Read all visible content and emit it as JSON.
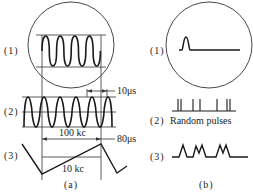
{
  "figure": {
    "panel_a": {
      "caption": "(a)",
      "rows": [
        {
          "label": "(1)",
          "description": "CRT display of sine wave within circular screen"
        },
        {
          "label": "(2)",
          "description": "Continuous sine wave"
        },
        {
          "label": "(3)",
          "description": "Sawtooth sweep"
        }
      ],
      "annotations": {
        "period_small": "10μs",
        "freq_high": "100 kc",
        "period_large": "80μs",
        "freq_low": "10 kc"
      }
    },
    "panel_b": {
      "caption": "(b)",
      "rows": [
        {
          "label": "(1)",
          "description": "CRT display of single pulse"
        },
        {
          "label": "(2)",
          "description": "Random pulses",
          "text": "Random pulses"
        },
        {
          "label": "(3)",
          "description": "Pulse train"
        }
      ]
    },
    "colors": {
      "stroke": "#1a1a1a",
      "thin": "#333333",
      "background": "#ffffff"
    }
  }
}
